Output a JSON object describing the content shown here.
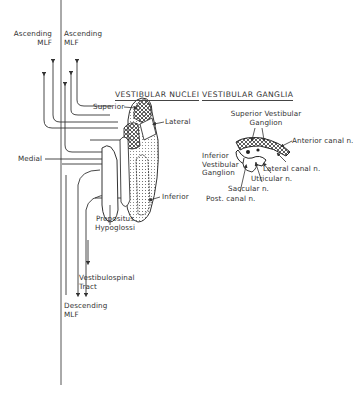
{
  "figure": {
    "type": "anatomical-diagram",
    "colors": {
      "line": "#3a3a3a",
      "text": "#333333",
      "background": "#ffffff"
    }
  },
  "pathways": {
    "ascending_left": {
      "line1": "Ascending",
      "line2": "MLF"
    },
    "ascending_right": {
      "line1": "Ascending",
      "line2": "MLF"
    },
    "medial_label": "Medial",
    "vestibulospinal": {
      "line1": "Vestibulospinal",
      "line2": "Tract"
    },
    "descending": {
      "line1": "Descending",
      "line2": "MLF"
    }
  },
  "nuclei": {
    "heading": "VESTIBULAR NUCLEI",
    "superior": "Superior",
    "lateral": "Lateral",
    "inferior": "Inferior",
    "prepositus": {
      "line1": "Prepositus",
      "line2": "Hypoglossi"
    }
  },
  "ganglia": {
    "heading": "VESTIBULAR GANGLIA",
    "superior": {
      "line1": "Superior Vestibular",
      "line2": "Ganglion"
    },
    "inferior": {
      "line1": "Inferior",
      "line2": "Vestibular",
      "line3": "Ganglion"
    },
    "anterior_canal": "Anterior canal n.",
    "lateral_canal": "Lateral canal n.",
    "utricular": "Utricular n.",
    "saccular": "Saccular n.",
    "posterior_canal": "Post. canal n."
  }
}
